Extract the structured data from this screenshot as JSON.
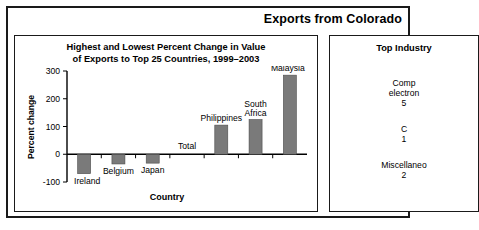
{
  "header": {
    "title": "Exports from Colorado"
  },
  "chart_panel": {
    "title_line1": "Highest and Lowest Percent Change in Value",
    "title_line2": "of Exports to Top 25 Countries, 1999–2003"
  },
  "industry_panel": {
    "title": "Top Industry",
    "entries": [
      {
        "line1": "Comp",
        "line2": "electron",
        "line3": "5"
      },
      {
        "line1": "C",
        "line2": "1",
        "line3": ""
      },
      {
        "line1": "Miscellaneo",
        "line2": "2",
        "line3": ""
      }
    ]
  },
  "chart_data": {
    "type": "bar",
    "title": "Highest and Lowest Percent Change in Value of Exports to Top 25 Countries, 1999–2003",
    "xlabel": "Country",
    "ylabel": "Percent change",
    "categories": [
      "Ireland",
      "Belgium",
      "Japan",
      "Total",
      "Philippines",
      "South Africa",
      "Malaysia"
    ],
    "values": [
      -70,
      -35,
      -32,
      0,
      105,
      125,
      285
    ],
    "ylim": [
      -100,
      300
    ],
    "yticks": [
      -100,
      0,
      100,
      200,
      300
    ],
    "ytick_labels": [
      "-100",
      "0",
      "100",
      "200",
      "300"
    ],
    "grid": false,
    "legend": null,
    "bar_color": "#7a7a7a",
    "axis_color": "#000000"
  }
}
